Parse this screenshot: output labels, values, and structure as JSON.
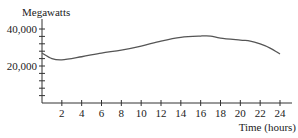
{
  "chart_data": {
    "type": "line",
    "title": "",
    "xlabel": "Time (hours)",
    "ylabel": "Megawatts",
    "xlim": [
      0,
      24
    ],
    "ylim": [
      0,
      40000
    ],
    "grid": false,
    "legend": null,
    "x_ticks": [
      2,
      4,
      6,
      8,
      10,
      12,
      14,
      16,
      18,
      20,
      22,
      24
    ],
    "x_tick_labels": [
      "2",
      "4",
      "6",
      "8",
      "10",
      "12",
      "14",
      "16",
      "18",
      "20",
      "22",
      "24"
    ],
    "y_ticks_minor": [
      0,
      4000,
      8000,
      12000,
      16000,
      20000,
      24000,
      28000,
      32000,
      36000,
      40000
    ],
    "y_tick_labels": [
      {
        "value": 20000,
        "label": "20,000"
      },
      {
        "value": 40000,
        "label": "40,000"
      }
    ],
    "series": [
      {
        "name": "Power consumption",
        "x": [
          0,
          1,
          2,
          4,
          6,
          8,
          10,
          12,
          14,
          16,
          17,
          18,
          20,
          21,
          22,
          23,
          24
        ],
        "values": [
          27000,
          24000,
          23300,
          25000,
          27000,
          28600,
          30800,
          33500,
          35500,
          36200,
          36200,
          35100,
          34000,
          33500,
          31900,
          29700,
          26500
        ]
      }
    ],
    "colors": {
      "line": "#555555",
      "axis": "#333333"
    }
  }
}
